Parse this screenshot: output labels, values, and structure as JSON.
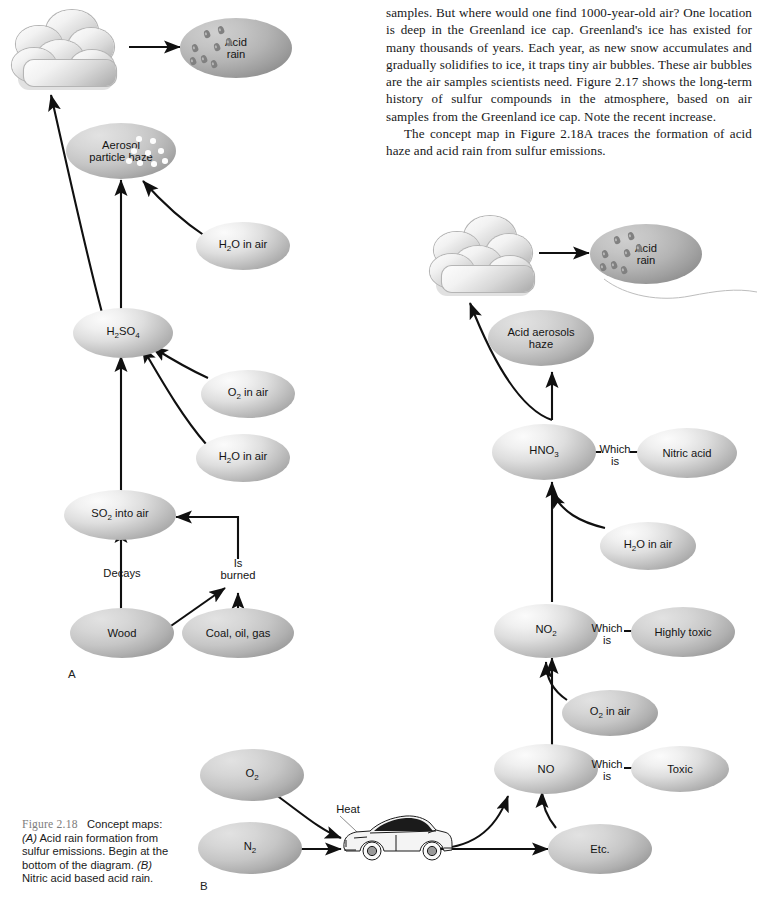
{
  "body_text": {
    "paragraphs": [
      "samples. But where would one find 1000-year-old air? One location is deep in the Greenland ice cap. Greenland's ice has existed for many thousands of years. Each year, as new snow accumulates and gradually solidifies to ice, it traps tiny air bubbles. These air bubbles are the air samples scientists need. Figure 2.17 shows the long-term history of sulfur compounds in the atmosphere, based on air samples from the Greenland ice cap. Note the recent increase.",
      "The concept map in Figure 2.18A traces the formation of acid haze and acid rain from sulfur emissions."
    ]
  },
  "caption": {
    "figure_label": "Figure 2.18",
    "text_1": "Concept maps:",
    "part_a": "(A)",
    "text_2": " Acid rain formation from sulfur emissions. Begin at the bottom of the diagram. ",
    "part_b": "(B)",
    "text_3": " Nitric acid based acid rain."
  },
  "diagram_a": {
    "panel_label": "A",
    "nodes": {
      "acid_rain": "Acid\nrain",
      "aerosol_haze": "Aerosol\nparticle haze",
      "h2o_air_upper": "H₂O in air",
      "h2so4": "H₂SO₄",
      "o2_air": "O₂ in air",
      "h2o_air_lower": "H₂O in air",
      "so2_air": "SO₂ into air",
      "wood": "Wood",
      "coal_oil_gas": "Coal, oil, gas"
    },
    "labels": {
      "decays": "Decays",
      "is_burned": "Is\nburned"
    },
    "icons": {
      "cloud": "cloud-icon",
      "raindrops": "raindrop-icon",
      "haze_particles": "haze-particle-icon"
    }
  },
  "diagram_b": {
    "panel_label": "B",
    "nodes": {
      "acid_rain": "Acid\nrain",
      "acid_aerosols_haze": "Acid aerosols\nhaze",
      "hno3": "HNO₃",
      "nitric_acid": "Nitric acid",
      "h2o_air": "H₂O in air",
      "no2": "NO₂",
      "highly_toxic": "Highly toxic",
      "o2_air": "O₂ in air",
      "no": "NO",
      "toxic": "Toxic",
      "etc": "Etc.",
      "o2": "O₂",
      "n2": "N₂"
    },
    "labels": {
      "which_is_1": "Which\nis",
      "which_is_2": "Which\nis",
      "which_is_3": "Which\nis",
      "heat": "Heat"
    },
    "icons": {
      "cloud": "cloud-icon",
      "raindrops": "raindrop-icon",
      "car": "car-icon"
    }
  },
  "colors": {
    "node_light": "#e4e4e4",
    "node_mid": "#c8c8c8",
    "node_dark": "#a8a8a8",
    "arrow": "#101010",
    "figure_label": "#7d7d7d",
    "text": "#141414"
  }
}
